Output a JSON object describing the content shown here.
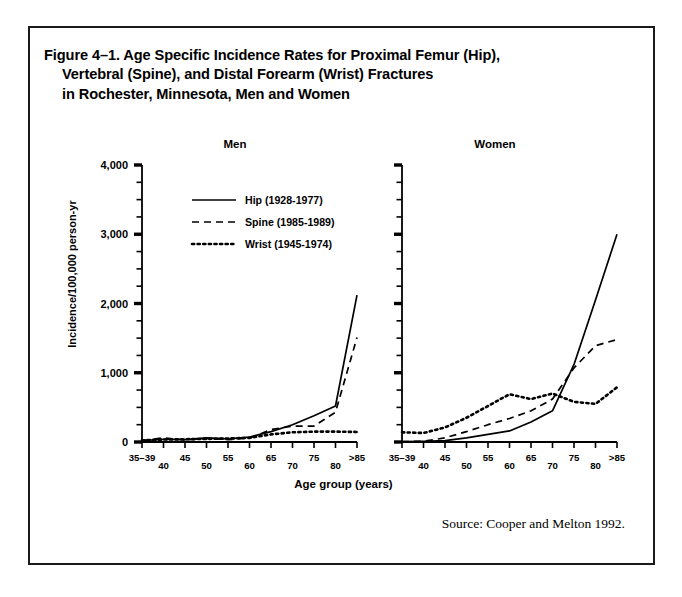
{
  "figure": {
    "title": "Figure 4–1. Age Specific Incidence Rates for Proximal Femur (Hip),\nVertebral (Spine), and Distal Forearm (Wrist) Fractures\nin Rochester, Minnesota, Men and Women",
    "source_note": "Source: Cooper and Melton 1992.",
    "x_axis_title": "Age group (years)",
    "y_axis_title": "Incidence/100,000 person-yr",
    "border_color": "#1a1a1a",
    "ink_color": "#000000",
    "background": "#ffffff"
  },
  "legend": {
    "entries": [
      {
        "label": "Hip (1928-1977)",
        "style": "solid",
        "key": "hip"
      },
      {
        "label": "Spine (1985-1989)",
        "style": "dashed",
        "key": "spine"
      },
      {
        "label": "Wrist (1945-1974)",
        "style": "dotted",
        "key": "wrist"
      }
    ]
  },
  "chart_data": {
    "type": "line",
    "title": "Figure 4–1. Age Specific Incidence Rates for Proximal Femur (Hip), Vertebral (Spine), and Distal Forearm (Wrist) Fractures in Rochester, Minnesota, Men and Women",
    "xlabel": "Age group (years)",
    "ylabel": "Incidence/100,000 person-yr",
    "ylim": [
      0,
      4000
    ],
    "yticks": [
      0,
      1000,
      2000,
      3000,
      4000
    ],
    "ytick_labels": [
      "0",
      "1,000",
      "2,000",
      "3,000",
      "4,000"
    ],
    "y_minor_interval": 250,
    "grid": false,
    "legend_position": "inside-upper-left-men-panel",
    "categories": [
      "35–39",
      "40",
      "45",
      "50",
      "55",
      "60",
      "65",
      "70",
      "75",
      "80",
      ">85"
    ],
    "panels": [
      {
        "name": "Men",
        "series": [
          {
            "name": "Hip (1928-1977)",
            "style": "solid",
            "values": [
              20,
              40,
              35,
              60,
              45,
              70,
              150,
              250,
              380,
              520,
              2120
            ]
          },
          {
            "name": "Spine (1985-1989)",
            "style": "dashed",
            "values": [
              20,
              60,
              30,
              50,
              35,
              55,
              180,
              230,
              230,
              430,
              1510
            ]
          },
          {
            "name": "Wrist (1945-1974)",
            "style": "dotted",
            "values": [
              25,
              35,
              40,
              45,
              50,
              60,
              110,
              140,
              150,
              150,
              145
            ]
          }
        ]
      },
      {
        "name": "Women",
        "series": [
          {
            "name": "Hip (1928-1977)",
            "style": "solid",
            "values": [
              5,
              10,
              20,
              60,
              110,
              160,
              290,
              450,
              1120,
              2050,
              3000
            ]
          },
          {
            "name": "Spine (1985-1989)",
            "style": "dashed",
            "values": [
              5,
              10,
              60,
              150,
              250,
              340,
              450,
              620,
              1070,
              1390,
              1480
            ]
          },
          {
            "name": "Wrist (1945-1974)",
            "style": "dotted",
            "values": [
              140,
              130,
              210,
              350,
              520,
              690,
              620,
              700,
              580,
              550,
              790
            ]
          }
        ]
      }
    ]
  }
}
